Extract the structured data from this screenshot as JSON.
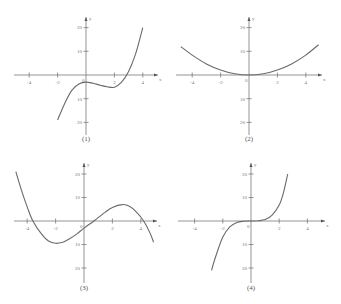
{
  "chart_data": [
    {
      "type": "line",
      "caption": "(1)",
      "xlabel": "x",
      "ylabel": "y",
      "xticks": [
        -4,
        -2,
        0,
        2,
        4
      ],
      "yticks": [
        20,
        10,
        -10,
        -20
      ],
      "xlim": [
        -5,
        5
      ],
      "ylim": [
        -25,
        25
      ],
      "series": [
        {
          "name": "f1",
          "x": [
            -2,
            -1.5,
            -1,
            -0.5,
            0,
            0.5,
            1,
            1.5,
            2,
            2.5,
            3,
            3.5,
            4
          ],
          "y": [
            -19,
            -12,
            -6.5,
            -3.8,
            -3,
            -3.5,
            -4.3,
            -5,
            -5.2,
            -3,
            1.5,
            9,
            20
          ]
        }
      ]
    },
    {
      "type": "line",
      "caption": "(2)",
      "xlabel": "x",
      "ylabel": "y",
      "xticks": [
        -4,
        -2,
        0,
        2,
        4
      ],
      "yticks": [
        20,
        10,
        -10,
        -20
      ],
      "xlim": [
        -5,
        5
      ],
      "ylim": [
        -25,
        25
      ],
      "series": [
        {
          "name": "f2",
          "x": [
            -4.8,
            -4,
            -3,
            -2,
            -1,
            0,
            1,
            2,
            3,
            4,
            4.9
          ],
          "y": [
            12,
            8.4,
            4.7,
            2.1,
            0.5,
            0,
            0.5,
            2.1,
            4.7,
            8.4,
            12.8
          ]
        }
      ]
    },
    {
      "type": "line",
      "caption": "(3)",
      "xlabel": "x",
      "ylabel": "y",
      "xticks": [
        -4,
        -2,
        0,
        2,
        4
      ],
      "yticks": [
        20,
        10,
        -10,
        -20
      ],
      "xlim": [
        -5,
        5
      ],
      "ylim": [
        -25,
        25
      ],
      "series": [
        {
          "name": "f3",
          "x": [
            -4.8,
            -4.4,
            -4,
            -3.6,
            -3,
            -2.5,
            -2,
            -1.5,
            -1,
            -0.5,
            0,
            0.7,
            1.5,
            2,
            2.7,
            3.2,
            3.7,
            4.2,
            4.6,
            4.9
          ],
          "y": [
            21,
            13,
            6,
            0,
            -5.5,
            -8.5,
            -9.5,
            -9,
            -7.5,
            -5.5,
            -3,
            0,
            3.8,
            5.8,
            7,
            6.3,
            3.8,
            0,
            -4.5,
            -9
          ]
        }
      ]
    },
    {
      "type": "line",
      "caption": "(4)",
      "xlabel": "x",
      "ylabel": "y",
      "xticks": [
        -4,
        -2,
        0,
        2,
        4
      ],
      "yticks": [
        20,
        10,
        -10,
        -20
      ],
      "xlim": [
        -5,
        5
      ],
      "ylim": [
        -25,
        25
      ],
      "series": [
        {
          "name": "f4",
          "x": [
            -2.8,
            -2.5,
            -2,
            -1.5,
            -1,
            -0.5,
            0,
            0.5,
            1,
            1.5,
            2,
            2.3,
            2.6
          ],
          "y": [
            -21,
            -15,
            -6.8,
            -2.5,
            -0.6,
            -0.1,
            0,
            0.1,
            0.6,
            2.5,
            6.8,
            12,
            20
          ]
        }
      ]
    }
  ],
  "labels": {
    "origin": "0",
    "x_axis": "x",
    "y_axis": "y",
    "captions": [
      "(1)",
      "(2)",
      "(3)",
      "(4)"
    ]
  }
}
